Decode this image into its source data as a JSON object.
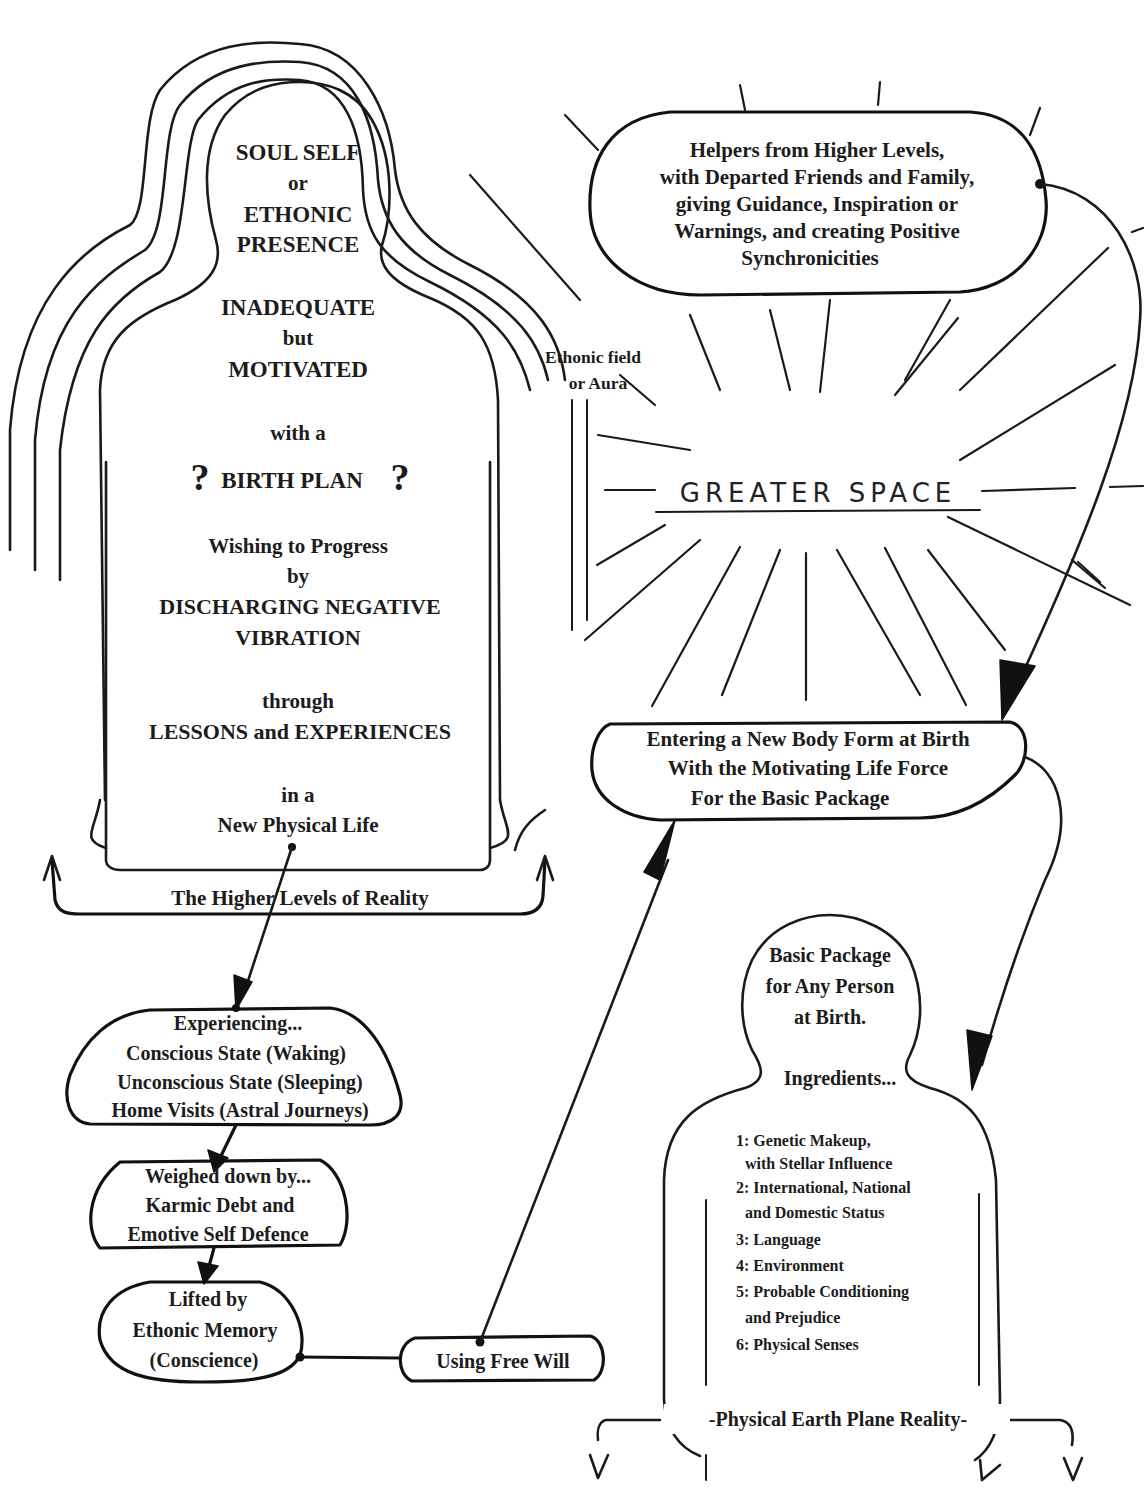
{
  "diagram": {
    "soul_figure": {
      "title_lines": [
        "SOUL SELF",
        "or",
        "ETHONIC",
        "PRESENCE"
      ],
      "state_lines": [
        "INADEQUATE",
        "but",
        "MOTIVATED"
      ],
      "with_a": "with a",
      "birth_plan": {
        "q_left": "?",
        "label": "BIRTH PLAN",
        "q_right": "?"
      },
      "progress_lines": [
        "Wishing to Progress",
        "by",
        "DISCHARGING NEGATIVE",
        "VIBRATION"
      ],
      "through_lines": [
        "through",
        "LESSONS and EXPERIENCES"
      ],
      "life_lines": [
        "in a",
        "New Physical Life"
      ],
      "base_label": "The Higher Levels of Reality"
    },
    "aura_label": [
      "Ethonic field",
      "or Aura"
    ],
    "helpers_box": {
      "lines": [
        "Helpers from Higher Levels,",
        "with Departed Friends and Family,",
        "giving Guidance, Inspiration or",
        "Warnings, and creating Positive",
        "Synchronicities"
      ]
    },
    "greater_space": "GREATER SPACE",
    "entering_box": {
      "lines": [
        "Entering a New Body Form at Birth",
        "With the Motivating Life Force",
        "For the Basic Package"
      ]
    },
    "experiencing_box": {
      "lines": [
        "Experiencing...",
        "Conscious State (Waking)",
        "Unconscious State (Sleeping)",
        "Home Visits (Astral Journeys)"
      ]
    },
    "weighed_box": {
      "lines": [
        "Weighed down by...",
        "Karmic Debt and",
        "Emotive Self Defence"
      ]
    },
    "lifted_box": {
      "lines": [
        "Lifted by",
        "Ethonic Memory",
        "(Conscience)"
      ]
    },
    "free_will_box": {
      "label": "Using Free Will"
    },
    "basic_package_figure": {
      "head_lines": [
        "Basic Package",
        "for Any Person",
        "at Birth."
      ],
      "ingredients_label": "Ingredients...",
      "ingredients": [
        "1: Genetic Makeup,",
        "  with Stellar Influence",
        "2: International, National",
        "  and Domestic Status",
        "3: Language",
        "4: Environment",
        "5: Probable Conditioning",
        "  and Prejudice",
        "6: Physical Senses"
      ],
      "base_label": "-Physical Earth Plane Reality-"
    },
    "colors": {
      "ink": "#1a1a1a",
      "paper": "#ffffff"
    }
  }
}
